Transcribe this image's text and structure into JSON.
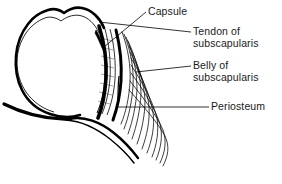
{
  "figure": {
    "background_color": "#ffffff",
    "ink_color": "#000000",
    "width": 282,
    "height": 184
  },
  "labels": {
    "capsule": "Capsule",
    "tendon_line1": "Tendon of",
    "tendon_line2": "subscapularis",
    "belly_line1": "Belly of",
    "belly_line2": "subscapularis",
    "periosteum": "Periosteum"
  },
  "structures": {
    "humeral_head": "humeral-head-outline",
    "capsule_bands": "capsule-layered-bands",
    "tendon_band": "tendon-solid-black-band",
    "muscle_fibers": "subscapularis-muscle-fiber-fan",
    "periosteum_edge": "periosteum-bone-surface"
  },
  "caption": {
    "partial_text": ""
  }
}
